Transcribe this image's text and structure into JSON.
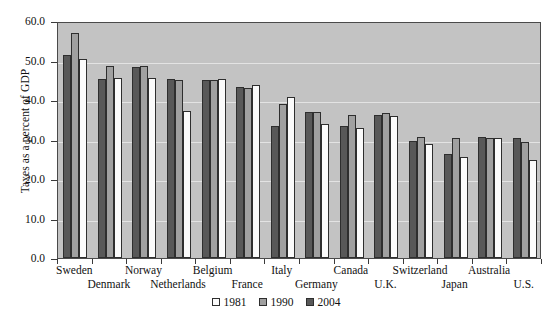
{
  "chart_data": {
    "type": "bar",
    "title": "",
    "xlabel": "",
    "ylabel": "Taxes as a percent of GDP",
    "ylim": [
      0.0,
      60.0
    ],
    "ytick_labels": [
      "60.0",
      "50.0",
      "40.0",
      "30.0",
      "20.0",
      "10.0",
      "0.0"
    ],
    "ytick_values": [
      60.0,
      50.0,
      40.0,
      30.0,
      20.0,
      10.0,
      0.0
    ],
    "grid": true,
    "legend_position": "bottom-center",
    "categories": [
      "Sweden",
      "Denmark",
      "Norway",
      "Netherlands",
      "Belgium",
      "France",
      "Italy",
      "Germany",
      "Canada",
      "U.K.",
      "Switzerland",
      "Japan",
      "Australia",
      "U.S."
    ],
    "series": [
      {
        "name": "2004",
        "color": "#585858",
        "values": [
          51.3,
          45.4,
          48.3,
          45.4,
          45.0,
          43.2,
          33.4,
          36.9,
          33.3,
          36.3,
          29.5,
          26.4,
          30.6,
          30.5
        ]
      },
      {
        "name": "1990",
        "color": "#a0a0a0",
        "values": [
          57.0,
          48.6,
          48.5,
          45.1,
          45.0,
          43.0,
          39.0,
          36.9,
          36.1,
          36.7,
          30.6,
          30.5,
          30.3,
          29.3
        ]
      },
      {
        "name": "1981",
        "color": "#fbfbfb",
        "values": [
          50.5,
          45.7,
          45.7,
          37.2,
          45.3,
          43.8,
          40.7,
          34.0,
          32.8,
          36.0,
          28.9,
          25.5,
          30.4,
          24.7
        ]
      }
    ]
  },
  "legend": {
    "entries": [
      {
        "label": "1981",
        "key": "y1981"
      },
      {
        "label": "1990",
        "key": "y1990"
      },
      {
        "label": "2004",
        "key": "y2004"
      }
    ]
  },
  "axis": {
    "y_title": "Taxes as a percent of GDP"
  }
}
